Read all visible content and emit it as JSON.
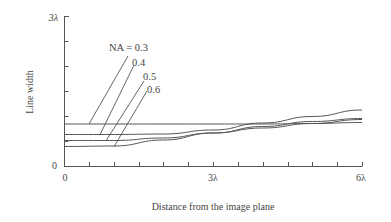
{
  "chart_data": {
    "type": "line",
    "title": "",
    "xlabel": "Distance from the image plane",
    "ylabel": "Line width",
    "xlim": [
      0,
      6
    ],
    "ylim": [
      0,
      3
    ],
    "x_unit": "λ",
    "y_unit": "λ",
    "x_tick_labels": [
      "0",
      "3λ",
      "6λ"
    ],
    "y_tick_labels": [
      "0",
      "3λ"
    ],
    "x_minor_tick_step": 0.5,
    "y_minor_tick_step": 0.5,
    "grid": false,
    "legend_position": "annotations with leader lines, upper-left",
    "x": [
      0,
      1,
      2,
      3,
      4,
      5,
      6
    ],
    "series": [
      {
        "name": "NA = 0.3",
        "label": "NA = 0.3",
        "values": [
          0.84,
          0.84,
          0.84,
          0.84,
          0.84,
          0.85,
          0.87
        ]
      },
      {
        "name": "NA = 0.4",
        "label": "0.4",
        "values": [
          0.63,
          0.63,
          0.64,
          0.72,
          0.86,
          0.99,
          1.12
        ]
      },
      {
        "name": "NA = 0.5",
        "label": "0.5",
        "values": [
          0.51,
          0.51,
          0.56,
          0.66,
          0.76,
          0.85,
          0.93
        ]
      },
      {
        "name": "NA = 0.6",
        "label": "0.6",
        "values": [
          0.39,
          0.4,
          0.52,
          0.66,
          0.79,
          0.89,
          0.95
        ]
      }
    ]
  },
  "axes": {
    "y_top_label": "3λ",
    "y_zero_label": "0",
    "x_zero_label": "0",
    "x_mid_label": "3λ",
    "x_end_label": "6λ",
    "x_title": "Distance from the image plane",
    "y_title": "Line width"
  },
  "annotations": {
    "na03": "NA = 0.3",
    "na04": "0.4",
    "na05": "0.5",
    "na06": "0.6"
  }
}
